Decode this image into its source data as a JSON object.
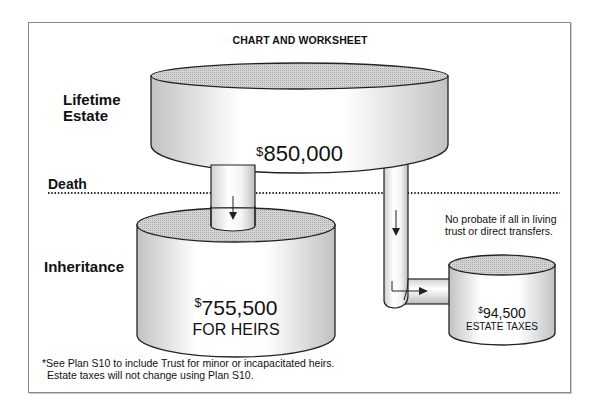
{
  "title": "CHART AND WORKSHEET",
  "labels": {
    "lifetime_line1": "Lifetime",
    "lifetime_line2": "Estate",
    "death": "Death",
    "inheritance": "Inheritance"
  },
  "containers": {
    "lifetime_estate": {
      "currency": "$",
      "amount": "850,000"
    },
    "heirs": {
      "currency": "$",
      "amount": "755,500",
      "caption": "FOR HEIRS"
    },
    "estate_taxes": {
      "currency": "$",
      "amount": "94,500",
      "caption": "ESTATE TAXES"
    }
  },
  "note": "No probate if all in living trust or direct transfers.",
  "footnote": {
    "line1": "*See Plan S10 to include Trust for minor or incapacitated heirs.",
    "line2": "Estate taxes will not change using Plan S10."
  },
  "colors": {
    "outline": "#222222",
    "shade": "#c9c9c9",
    "frame": "#8a8a8a"
  }
}
